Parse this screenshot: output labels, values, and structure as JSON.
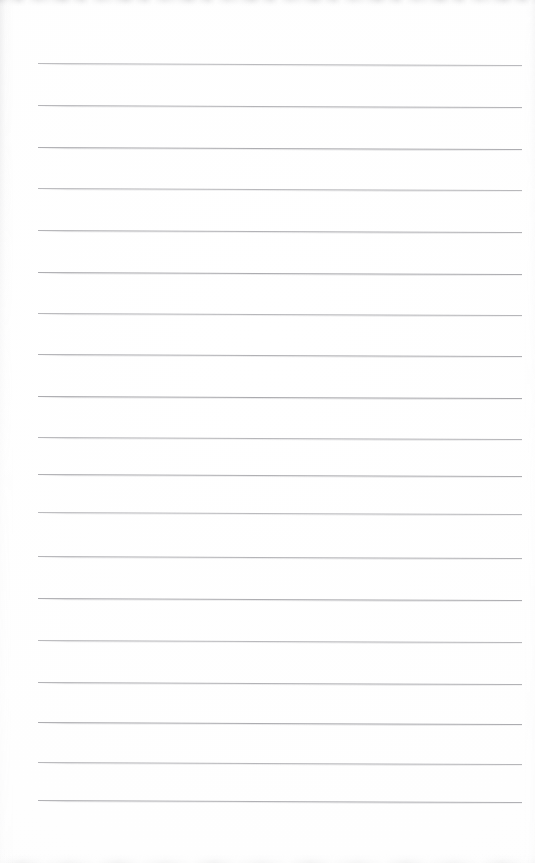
{
  "document": {
    "title": "Blank ruled notebook page (scan)",
    "kind": "scanned-document",
    "page_width": 535,
    "page_height": 863,
    "paper_color": "#fefefe",
    "has_text": false,
    "has_handwriting": false,
    "has_margin_rule": false,
    "visible_text": ""
  },
  "ruling": {
    "line_count": 19,
    "line_color": "#a9a9ad",
    "line_thickness_px": 1,
    "line_spacing_px": 41.5,
    "line_start_x": 38,
    "line_end_x": 522,
    "skew_drop_px": 2,
    "first_line_y": 63,
    "last_line_y": 800,
    "line_y_positions": [
      63,
      105,
      147,
      188,
      230,
      272,
      313,
      354,
      396,
      437,
      474,
      512,
      556,
      598,
      640,
      682,
      722,
      762,
      800
    ]
  },
  "scan_artifacts": {
    "top_band_label": "top-edge-scan-band",
    "bottom_band_label": "bottom-edge-scan-band",
    "left_band_label": "left-edge-scan-band",
    "right_band_label": "right-edge-scan-band",
    "artifact_color": "#d0d0d3"
  }
}
